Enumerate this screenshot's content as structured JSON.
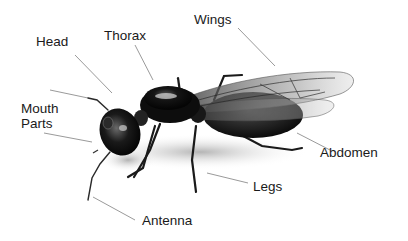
{
  "diagram": {
    "labels": {
      "head": "Head",
      "thorax": "Thorax",
      "wings": "Wings",
      "mouth_parts_line1": "Mouth",
      "mouth_parts_line2": "Parts",
      "abdomen": "Abdomen",
      "legs": "Legs",
      "antenna": "Antenna"
    },
    "colors": {
      "label_text": "#1a1a1a",
      "leader_line": "#9a9a9a",
      "body": "#111111",
      "wing": "#8a8a8a"
    }
  }
}
